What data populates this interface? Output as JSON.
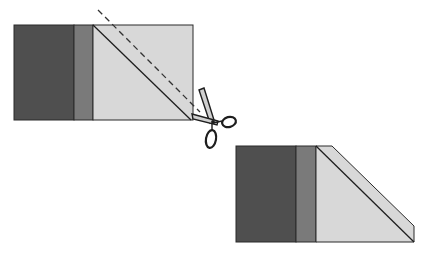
{
  "diagram": {
    "type": "quilting-cut-instruction",
    "colors": {
      "background": "#ffffff",
      "dark_fabric": "#4f4f4f",
      "medium_fabric": "#7a7a7a",
      "light_fabric": "#d8d8d8",
      "outline": "#2a2a2a"
    },
    "step1": {
      "name": "pieced-rectangle-with-stitch-and-cut-lines",
      "strips": [
        "dark",
        "medium",
        "light"
      ],
      "stitch_line": "solid diagonal",
      "cut_line": "dashed diagonal"
    },
    "tool": {
      "icon": "scissors-icon"
    },
    "step2": {
      "name": "trimmed-unit-with-folded-corner",
      "strips": [
        "dark",
        "medium",
        "light-trapezoid"
      ]
    }
  }
}
